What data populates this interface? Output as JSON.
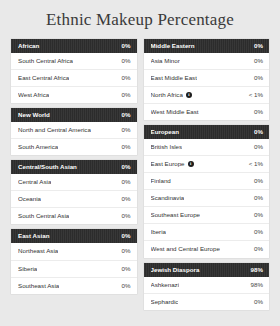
{
  "header": {
    "title": "Ethnic Makeup Percentage"
  },
  "colors": {
    "page_background": "#e9e9e9",
    "card_background": "#ffffff",
    "group_header_background": "#2c2c2c",
    "group_header_text": "#ffffff",
    "row_text": "#333333"
  },
  "icons": {
    "info": "i",
    "info_name": "info-icon"
  },
  "columns": [
    {
      "name": "left-column",
      "groups": [
        {
          "label": "African",
          "value": "0%",
          "rows": [
            {
              "label": "South Central Africa",
              "value": "0%",
              "info": false
            },
            {
              "label": "East Central Africa",
              "value": "0%",
              "info": false
            },
            {
              "label": "West Africa",
              "value": "0%",
              "info": false
            }
          ]
        },
        {
          "label": "New World",
          "value": "0%",
          "rows": [
            {
              "label": "North and Central America",
              "value": "0%",
              "info": false
            },
            {
              "label": "South America",
              "value": "0%",
              "info": false
            }
          ]
        },
        {
          "label": "Central/South Asian",
          "value": "0%",
          "rows": [
            {
              "label": "Central Asia",
              "value": "0%",
              "info": false
            },
            {
              "label": "Oceania",
              "value": "0%",
              "info": false
            },
            {
              "label": "South Central Asia",
              "value": "0%",
              "info": false
            }
          ]
        },
        {
          "label": "East Asian",
          "value": "0%",
          "rows": [
            {
              "label": "Northeast Asia",
              "value": "0%",
              "info": false
            },
            {
              "label": "Siberia",
              "value": "0%",
              "info": false
            },
            {
              "label": "Southeast Asia",
              "value": "0%",
              "info": false
            }
          ]
        }
      ]
    },
    {
      "name": "right-column",
      "groups": [
        {
          "label": "Middle Eastern",
          "value": "0%",
          "rows": [
            {
              "label": "Asia Minor",
              "value": "0%",
              "info": false
            },
            {
              "label": "East Middle East",
              "value": "0%",
              "info": false
            },
            {
              "label": "North Africa",
              "value": "< 1%",
              "info": true
            },
            {
              "label": "West Middle East",
              "value": "0%",
              "info": false
            }
          ]
        },
        {
          "label": "European",
          "value": "0%",
          "rows": [
            {
              "label": "British Isles",
              "value": "0%",
              "info": false
            },
            {
              "label": "East Europe",
              "value": "< 1%",
              "info": true
            },
            {
              "label": "Finland",
              "value": "0%",
              "info": false
            },
            {
              "label": "Scandinavia",
              "value": "0%",
              "info": false
            },
            {
              "label": "Southeast Europe",
              "value": "0%",
              "info": false
            },
            {
              "label": "Iberia",
              "value": "0%",
              "info": false
            },
            {
              "label": "West and Central Europe",
              "value": "0%",
              "info": false
            }
          ]
        },
        {
          "label": "Jewish Diaspora",
          "value": "98%",
          "rows": [
            {
              "label": "Ashkenazi",
              "value": "98%",
              "info": false
            },
            {
              "label": "Sephardic",
              "value": "0%",
              "info": false
            }
          ]
        }
      ]
    }
  ]
}
